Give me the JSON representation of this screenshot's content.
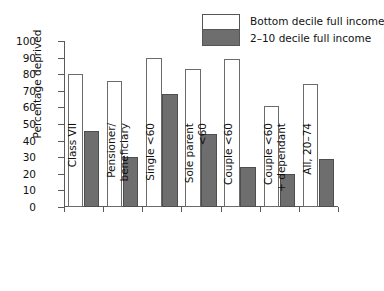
{
  "chart_data": {
    "type": "bar",
    "title": "",
    "subtitle": "",
    "xlabel": "",
    "ylabel": "Percentage deprived",
    "ylim": [
      0,
      100
    ],
    "ytick_step": 10,
    "yticks": [
      "100",
      "90",
      "80",
      "70",
      "60",
      "50",
      "40",
      "30",
      "20",
      "10",
      "0"
    ],
    "grid": false,
    "legend_position": "top-right",
    "categories": [
      "Class VII",
      "Pensioner/\nbeneficiary",
      "Single <60",
      "Sole parent\n<60",
      "Couple <60",
      "Couple <60\n+ dependant",
      "All, 20–74"
    ],
    "series": [
      {
        "name": "Bottom decile full income",
        "color": "#ffffff",
        "values": [
          80,
          76,
          90,
          83,
          89,
          61,
          74
        ]
      },
      {
        "name": "2–10 decile full income",
        "color": "#6e6e6e",
        "values": [
          46,
          30,
          68,
          44,
          24,
          20,
          29
        ]
      }
    ]
  },
  "legend": {
    "entries": [
      {
        "label": "Bottom decile full income",
        "swatch": "white-swatch"
      },
      {
        "label": "2–10 decile full income",
        "swatch": "gray-swatch"
      }
    ]
  },
  "axes": {
    "y_title": "Percentage deprived"
  },
  "colors": {
    "series_light": "#ffffff",
    "series_dark": "#6e6e6e",
    "axis": "#5a5a5a",
    "text": "#111111",
    "background": "#ffffff"
  }
}
